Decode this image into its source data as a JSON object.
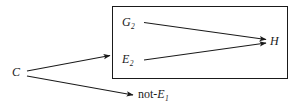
{
  "figure": {
    "type": "causal-inference-diagram",
    "canvas": {
      "width": 303,
      "height": 107,
      "background": "#ffffff"
    },
    "stroke_color": "#1a1a1a",
    "nodes": {
      "cause": {
        "label": "C",
        "italic": true,
        "x": 15,
        "y": 73
      },
      "generalization": {
        "base": "G",
        "subscript": "2",
        "x": 125,
        "y": 22
      },
      "evidence": {
        "base": "E",
        "subscript": "2",
        "x": 125,
        "y": 59
      },
      "hypothesis": {
        "label": "H",
        "italic": true,
        "x": 272,
        "y": 41
      },
      "negated_evidence": {
        "prefix": "not-",
        "base": "E",
        "subscript": "1",
        "x": 141,
        "y": 94
      }
    },
    "box": {
      "name": "grouping-box",
      "x": 112,
      "y": 6,
      "width": 176,
      "height": 73,
      "border_color": "#1a1a1a",
      "border_width": 1,
      "fill": "#ffffff"
    },
    "edges": [
      {
        "name": "c-to-box",
        "from": "C",
        "to": "grouping-box-left-edge",
        "arrowhead": true
      },
      {
        "name": "c-to-not-e1",
        "from": "C",
        "to": "not-E1",
        "arrowhead": true
      },
      {
        "name": "g2-to-h",
        "from": "G2",
        "to": "H",
        "arrowhead": true
      },
      {
        "name": "e2-to-h",
        "from": "E2",
        "to": "H",
        "arrowhead": true
      }
    ]
  }
}
